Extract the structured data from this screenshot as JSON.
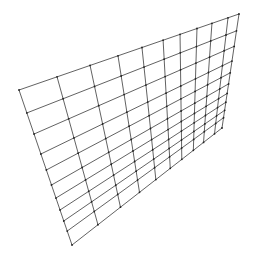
{
  "diagram": {
    "type": "warped-grid",
    "columns": 10,
    "rows": 10,
    "corners": {
      "top_left": [
        19,
        90
      ],
      "top_right": [
        239,
        14
      ],
      "bottom_right": [
        222,
        128
      ],
      "bottom_left": [
        72,
        245
      ]
    },
    "u_params": [
      0,
      0.173,
      0.323,
      0.45,
      0.559,
      0.655,
      0.732,
      0.809,
      0.877,
      0.95,
      1
    ],
    "v_params": [
      0,
      0.148,
      0.284,
      0.413,
      0.516,
      0.613,
      0.697,
      0.774,
      0.845,
      0.91,
      1
    ],
    "line_color": "#3a3a3a",
    "vertex_color": "#222222",
    "line_width": 0.8,
    "vertex_radius": 0.9,
    "background": "#ffffff"
  }
}
